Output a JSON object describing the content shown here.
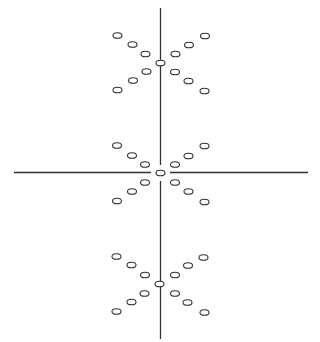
{
  "diagram": {
    "width": 320,
    "height": 342,
    "stroke_color": "#333333",
    "background": "#ffffff",
    "ellipse_rx": 4.5,
    "ellipse_ry": 2.8,
    "lines": [
      {
        "name": "vertical-axis-upper",
        "x1": 160.5,
        "y1": 8,
        "x2": 160.5,
        "y2": 165
      },
      {
        "name": "vertical-axis-lower",
        "x1": 160.5,
        "y1": 181,
        "x2": 160.5,
        "y2": 339
      },
      {
        "name": "horizontal-axis-left",
        "x1": 14,
        "y1": 172.5,
        "x2": 151,
        "y2": 172.5
      },
      {
        "name": "horizontal-axis-right",
        "x1": 170,
        "y1": 172.5,
        "x2": 308,
        "y2": 172.5
      }
    ],
    "clusters": [
      {
        "name": "top-cluster",
        "points": [
          [
            117.5,
            35.5
          ],
          [
            132.5,
            44.5
          ],
          [
            145.5,
            54
          ],
          [
            160.5,
            63
          ],
          [
            146.5,
            71.5
          ],
          [
            133,
            80.5
          ],
          [
            117.5,
            90
          ],
          [
            205,
            36
          ],
          [
            189,
            45
          ],
          [
            175.5,
            54
          ],
          [
            175,
            72
          ],
          [
            188.5,
            81
          ],
          [
            204.5,
            91
          ]
        ]
      },
      {
        "name": "middle-cluster",
        "points": [
          [
            117,
            145.5
          ],
          [
            132,
            155.5
          ],
          [
            145,
            164.5
          ],
          [
            160.5,
            173
          ],
          [
            145,
            182.5
          ],
          [
            132,
            191.5
          ],
          [
            117,
            201
          ],
          [
            204.5,
            146
          ],
          [
            188.5,
            156
          ],
          [
            175,
            164.5
          ],
          [
            175,
            182.5
          ],
          [
            188.5,
            191.5
          ],
          [
            204.5,
            202
          ]
        ]
      },
      {
        "name": "bottom-cluster",
        "points": [
          [
            116.5,
            256.5
          ],
          [
            131.5,
            265
          ],
          [
            145,
            275
          ],
          [
            159.5,
            284
          ],
          [
            144.5,
            293.5
          ],
          [
            131.5,
            302
          ],
          [
            116.5,
            311.5
          ],
          [
            203.5,
            257.5
          ],
          [
            188,
            265.5
          ],
          [
            175,
            275
          ],
          [
            175,
            293.5
          ],
          [
            187.5,
            302.5
          ],
          [
            204.5,
            312.5
          ]
        ]
      }
    ]
  }
}
